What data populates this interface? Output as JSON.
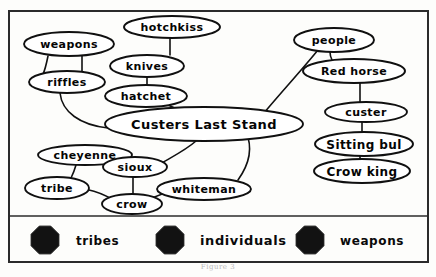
{
  "figure": {
    "caption": "Figure 3"
  },
  "nodes": [
    {
      "id": "weapons",
      "label": "weapons",
      "cx": 69,
      "cy": 44,
      "rx": 45,
      "ry": 12,
      "fontsize": 11
    },
    {
      "id": "hotchkiss",
      "label": "hotchkiss",
      "cx": 172,
      "cy": 27,
      "rx": 48,
      "ry": 11,
      "fontsize": 11
    },
    {
      "id": "knives",
      "label": "knives",
      "cx": 147,
      "cy": 66,
      "rx": 37,
      "ry": 11,
      "fontsize": 11
    },
    {
      "id": "riffles",
      "label": "riffles",
      "cx": 67,
      "cy": 82,
      "rx": 38,
      "ry": 11,
      "fontsize": 11
    },
    {
      "id": "hatchet",
      "label": "hatchet",
      "cx": 146,
      "cy": 96,
      "rx": 41,
      "ry": 11,
      "fontsize": 11
    },
    {
      "id": "clstand",
      "label": "Custers Last Stand",
      "cx": 204,
      "cy": 124,
      "rx": 99,
      "ry": 17,
      "fontsize": 13
    },
    {
      "id": "people",
      "label": "people",
      "cx": 334,
      "cy": 40,
      "rx": 40,
      "ry": 12,
      "fontsize": 11
    },
    {
      "id": "redhorse",
      "label": "Red horse",
      "cx": 354,
      "cy": 71,
      "rx": 51,
      "ry": 12,
      "fontsize": 11
    },
    {
      "id": "custer",
      "label": "custer",
      "cx": 366,
      "cy": 112,
      "rx": 41,
      "ry": 10,
      "fontsize": 11
    },
    {
      "id": "sittingbul",
      "label": "Sitting bul",
      "cx": 364,
      "cy": 144,
      "rx": 49,
      "ry": 12,
      "fontsize": 12
    },
    {
      "id": "crowking",
      "label": "Crow king",
      "cx": 362,
      "cy": 171,
      "rx": 48,
      "ry": 12,
      "fontsize": 12
    },
    {
      "id": "cheyenne",
      "label": "cheyenne",
      "cx": 85,
      "cy": 155,
      "rx": 47,
      "ry": 10,
      "fontsize": 11
    },
    {
      "id": "sioux",
      "label": "sioux",
      "cx": 135,
      "cy": 167,
      "rx": 32,
      "ry": 10,
      "fontsize": 11
    },
    {
      "id": "tribe",
      "label": "tribe",
      "cx": 57,
      "cy": 188,
      "rx": 32,
      "ry": 11,
      "fontsize": 11
    },
    {
      "id": "whiteman",
      "label": "whiteman",
      "cx": 204,
      "cy": 189,
      "rx": 47,
      "ry": 11,
      "fontsize": 11
    },
    {
      "id": "crow",
      "label": "crow",
      "cx": 132,
      "cy": 204,
      "rx": 30,
      "ry": 10,
      "fontsize": 11
    }
  ],
  "edges": [
    {
      "from": "weapons",
      "to": "riffles"
    },
    {
      "from": "weapons",
      "to": "riffles2"
    },
    {
      "from": "hotchkiss",
      "to": "knives"
    },
    {
      "from": "knives",
      "to": "hatchet"
    },
    {
      "from": "riffles",
      "to": "clstand"
    },
    {
      "from": "hatchet",
      "to": "clstand"
    },
    {
      "from": "clstand",
      "to": "people"
    },
    {
      "from": "people",
      "to": "redhorse"
    },
    {
      "from": "redhorse",
      "to": "custer"
    },
    {
      "from": "custer",
      "to": "sittingbul"
    },
    {
      "from": "sittingbul",
      "to": "crowking"
    },
    {
      "from": "clstand",
      "to": "sioux"
    },
    {
      "from": "cheyenne",
      "to": "tribe"
    },
    {
      "from": "sioux",
      "to": "crow"
    },
    {
      "from": "tribe",
      "to": "crow"
    },
    {
      "from": "crow",
      "to": "whiteman"
    }
  ],
  "legend": {
    "items": [
      {
        "id": "tribes",
        "label": "tribes",
        "marker": "filled-octagon",
        "color": "#121212"
      },
      {
        "id": "individuals",
        "label": "individuals",
        "marker": "filled-octagon",
        "color": "#121212"
      },
      {
        "id": "weapons",
        "label": "weapons",
        "marker": "filled-octagon",
        "color": "#121212"
      }
    ]
  }
}
